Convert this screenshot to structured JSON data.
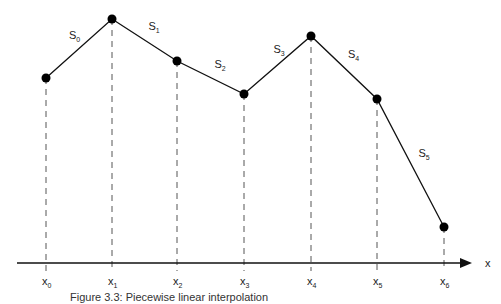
{
  "diagram": {
    "title": "Piecewise linear interpolation",
    "axis_label": "x",
    "points": [
      {
        "name": "x",
        "sub": "0",
        "px": 46,
        "py": 78
      },
      {
        "name": "x",
        "sub": "1",
        "px": 112,
        "py": 19
      },
      {
        "name": "x",
        "sub": "2",
        "px": 177,
        "py": 61
      },
      {
        "name": "x",
        "sub": "3",
        "px": 244,
        "py": 94
      },
      {
        "name": "x",
        "sub": "4",
        "px": 311,
        "py": 36
      },
      {
        "name": "x",
        "sub": "5",
        "px": 377,
        "py": 99
      },
      {
        "name": "x",
        "sub": "6",
        "px": 444,
        "py": 227
      }
    ],
    "segments": [
      {
        "name": "S",
        "sub": "0"
      },
      {
        "name": "S",
        "sub": "1"
      },
      {
        "name": "S",
        "sub": "2"
      },
      {
        "name": "S",
        "sub": "3"
      },
      {
        "name": "S",
        "sub": "4"
      },
      {
        "name": "S",
        "sub": "5"
      }
    ],
    "axis_y": 263,
    "axis_x_start": 17,
    "axis_x_end": 472
  },
  "caption": "Figure 3.3: Piecewise linear interpolation"
}
